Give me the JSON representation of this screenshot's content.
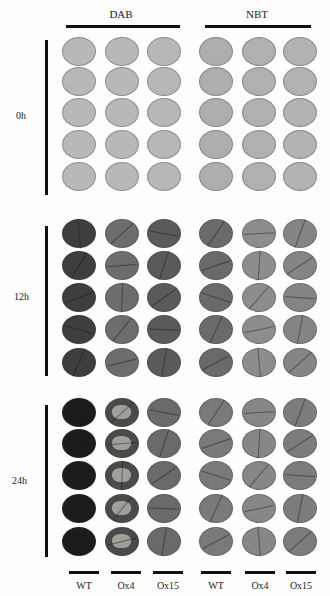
{
  "figure": {
    "stains": [
      {
        "label": "DAB"
      },
      {
        "label": "NBT"
      }
    ],
    "timepoints": [
      {
        "label": "0h"
      },
      {
        "label": "12h"
      },
      {
        "label": "24h"
      }
    ],
    "genotypes": [
      {
        "label": "WT"
      },
      {
        "label": "Ox4"
      },
      {
        "label": "Ox15"
      },
      {
        "label": "WT"
      },
      {
        "label": "Ox4"
      },
      {
        "label": "Ox15"
      }
    ],
    "replicates_per_group": 5,
    "disc_colors": {
      "0h": [
        "#b8b8b8",
        "#b8b8b8",
        "#b7b7b7",
        "#aeaeae",
        "#b0b0b0",
        "#b2b2b2"
      ],
      "12h": [
        "#3e3e3e",
        "#6d6d6d",
        "#5a5a5a",
        "#6a6a6a",
        "#8d8d8d",
        "#858585"
      ],
      "24h": [
        "#1c1c1c",
        "#4a4a48",
        "#6a6a6a",
        "#7a7a7a",
        "#878787",
        "#7c7c7c"
      ]
    }
  }
}
